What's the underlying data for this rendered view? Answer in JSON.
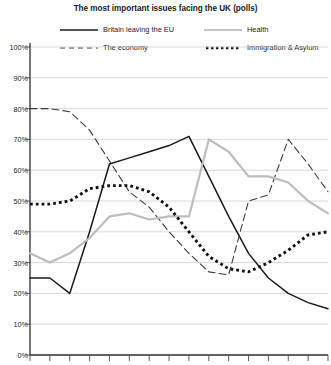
{
  "chart_data": {
    "type": "line",
    "title": "The most important issues facing the UK (polls)",
    "xlabel": "",
    "ylabel": "",
    "ylim": [
      0,
      100
    ],
    "ytick_labels": [
      "0%",
      "10%",
      "20%",
      "30%",
      "40%",
      "50%",
      "60%",
      "70%",
      "80%",
      "90%",
      "100%"
    ],
    "ytick_values": [
      0,
      10,
      20,
      30,
      40,
      50,
      60,
      70,
      80,
      90,
      100
    ],
    "grid": true,
    "legend_position": "top",
    "x_count": 16,
    "x": [
      1,
      2,
      3,
      4,
      5,
      6,
      7,
      8,
      9,
      10,
      11,
      12,
      13,
      14,
      15,
      16
    ],
    "xtick_labels": [
      "",
      "",
      "",
      "",
      "",
      "",
      "",
      "",
      "",
      "",
      "",
      "",
      "",
      "",
      "",
      ""
    ],
    "series": [
      {
        "name": "Britain leaving the EU",
        "color": "#1a1a1a",
        "style": "solid",
        "values": [
          25,
          25,
          20,
          40,
          62,
          64,
          66,
          68,
          71,
          58,
          45,
          33,
          25,
          20,
          17,
          15
        ]
      },
      {
        "name": "The economy",
        "color": "#3a3a3a",
        "style": "dashed",
        "values": [
          80,
          80,
          79,
          73,
          63,
          53,
          48,
          40,
          33,
          27,
          26,
          50,
          52,
          70,
          62,
          53
        ]
      },
      {
        "name": "Health",
        "color": "#bdbdbd",
        "style": "solid",
        "values": [
          33,
          30,
          33,
          38,
          45,
          46,
          44,
          45,
          45,
          70,
          66,
          58,
          58,
          56,
          50,
          46
        ]
      },
      {
        "name": "Immigration & Asylum",
        "color": "#111111",
        "style": "dotted",
        "values": [
          49,
          49,
          50,
          54,
          55,
          55,
          53,
          48,
          40,
          32,
          28,
          27,
          30,
          34,
          39,
          40
        ]
      }
    ]
  },
  "legend": {
    "items": [
      {
        "label": "Britain leaving the EU",
        "icon": "solid-line-icon"
      },
      {
        "label": "Health",
        "icon": "solid-gray-line-icon"
      },
      {
        "label": "The economy",
        "icon": "dashed-line-icon"
      },
      {
        "label": "Immigration & Asylum",
        "icon": "dotted-line-icon"
      }
    ]
  }
}
